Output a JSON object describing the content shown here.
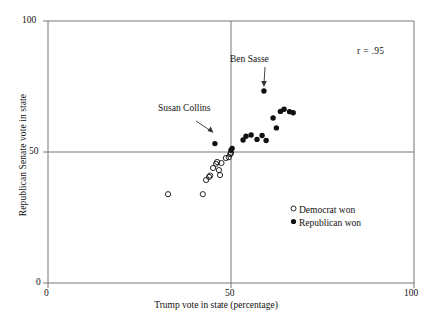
{
  "chart_data": {
    "type": "scatter",
    "title": "",
    "xlabel": "Trump vote in state (percentage)",
    "ylabel": "Republican Senate vote in state",
    "xlim": [
      0,
      100
    ],
    "ylim": [
      0,
      100
    ],
    "xticks": [
      "0",
      "50",
      "100"
    ],
    "yticks": [
      "0",
      "50",
      "100"
    ],
    "grid": false,
    "reference_lines": [
      {
        "axis": "x",
        "value": 50
      },
      {
        "axis": "y",
        "value": 50
      }
    ],
    "annotations": [
      {
        "name": "correlation",
        "text": "r = .95",
        "x": 85,
        "y": 88
      },
      {
        "name": "ben-sasse-label",
        "text": "Ben Sasse",
        "x": 60.5,
        "y": 81
      },
      {
        "name": "susan-collins-label",
        "text": "Susan Collins",
        "x": 39.5,
        "y": 71
      }
    ],
    "legend": {
      "position": "inside-lower-right",
      "entries": [
        {
          "label": "Democrat won",
          "marker": "open-circle"
        },
        {
          "label": "Republican won",
          "marker": "filled-circle"
        }
      ]
    },
    "series": [
      {
        "name": "Democrat won",
        "marker": "open-circle",
        "points": [
          {
            "x": 32.8,
            "y": 33.9
          },
          {
            "x": 42.3,
            "y": 33.9
          },
          {
            "x": 43.2,
            "y": 39.3
          },
          {
            "x": 44.0,
            "y": 40.5
          },
          {
            "x": 44.3,
            "y": 41.0
          },
          {
            "x": 45.1,
            "y": 43.9
          },
          {
            "x": 45.9,
            "y": 45.5
          },
          {
            "x": 46.2,
            "y": 46.2
          },
          {
            "x": 46.7,
            "y": 43.1
          },
          {
            "x": 47.0,
            "y": 41.2
          },
          {
            "x": 47.4,
            "y": 45.8
          },
          {
            "x": 48.6,
            "y": 47.7
          },
          {
            "x": 49.4,
            "y": 48.0
          },
          {
            "x": 49.8,
            "y": 49.2
          },
          {
            "x": 50.0,
            "y": 49.6
          }
        ]
      },
      {
        "name": "Republican won",
        "marker": "filled-circle",
        "points": [
          {
            "x": 45.6,
            "y": 53.2
          },
          {
            "x": 50.0,
            "y": 50.7
          },
          {
            "x": 50.3,
            "y": 51.4
          },
          {
            "x": 53.3,
            "y": 54.6
          },
          {
            "x": 54.1,
            "y": 56.0
          },
          {
            "x": 55.5,
            "y": 56.5
          },
          {
            "x": 57.1,
            "y": 54.8
          },
          {
            "x": 58.5,
            "y": 56.3
          },
          {
            "x": 59.6,
            "y": 54.4
          },
          {
            "x": 59.0,
            "y": 73.3
          },
          {
            "x": 61.5,
            "y": 63.0
          },
          {
            "x": 62.4,
            "y": 59.2
          },
          {
            "x": 63.5,
            "y": 65.5
          },
          {
            "x": 64.5,
            "y": 66.3
          },
          {
            "x": 66.0,
            "y": 65.4
          },
          {
            "x": 67.0,
            "y": 65.0
          }
        ]
      }
    ],
    "highlighted_points": [
      {
        "name": "ben-sasse-point",
        "x": 59.0,
        "y": 73.3,
        "series": "Republican won"
      },
      {
        "name": "susan-collins-point",
        "x": 45.6,
        "y": 53.2,
        "series": "Republican won"
      }
    ]
  },
  "axis": {
    "y_top": "100",
    "y_mid": "50",
    "y_bottom": "0",
    "x_left": "0",
    "x_mid": "50",
    "x_right": "100",
    "x_title": "Trump vote in state (percentage)",
    "y_title": "Republican Senate vote in state"
  },
  "labels": {
    "correlation": "r = .95",
    "ben_sasse": "Ben Sasse",
    "susan_collins": "Susan Collins"
  },
  "legend": {
    "democrat": "Democrat won",
    "republican": "Republican won"
  },
  "colors": {
    "axis": "#777777",
    "marker": "#111111",
    "text": "#111111",
    "background": "#ffffff"
  }
}
